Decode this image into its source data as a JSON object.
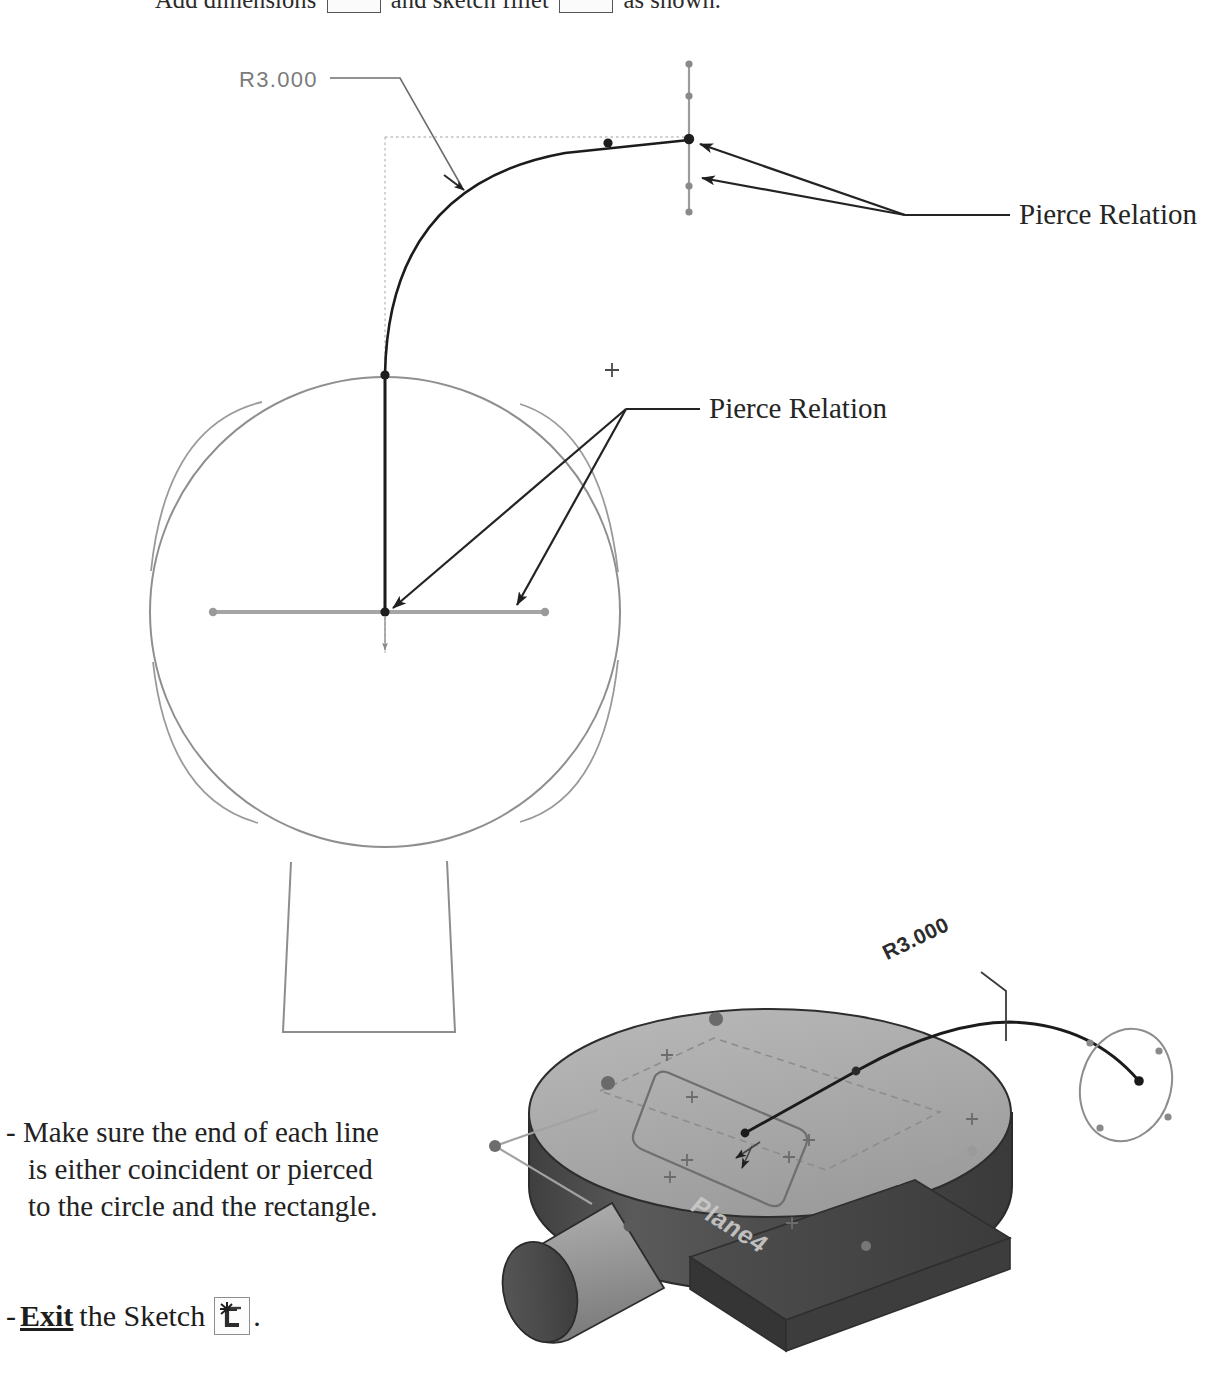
{
  "page": {
    "background_color": "#ffffff",
    "width": 1220,
    "height": 1383
  },
  "top_instruction": {
    "text_before": "Add dimensions",
    "text_middle": "and sketch fillet",
    "text_after": "as shown.",
    "dimension_icon_name": "smart-dimension-icon",
    "fillet_icon_name": "sketch-fillet-icon"
  },
  "sketch_view_2d": {
    "radius_dimension_label": "R3.000",
    "annotations": [
      {
        "id": "pierce-top",
        "label": "Pierce Relation"
      },
      {
        "id": "pierce-middle",
        "label": "Pierce Relation"
      }
    ],
    "entity_colors": {
      "active_sketch_line": "#1c1c1c",
      "reference_geometry": "#8e8e8e",
      "construction_dotted": "#b4b4b4",
      "dimension_text": "#7b7b7b",
      "leader_line": "#2a2a2a"
    }
  },
  "model_view_3d": {
    "radius_dimension_label": "R3.000",
    "plane_label": "Plane4",
    "surface_colors": {
      "top_face": "#adadad",
      "front_dark_face": "#4c4c4c",
      "side_face": "#6e6e6e",
      "boss_light": "#a8a8a8",
      "outline": "#2f2f2f"
    }
  },
  "notes": {
    "bullet": "-",
    "lines": [
      "Make sure the end of each line",
      "is either coincident or pierced",
      "to the circle and the rectangle."
    ]
  },
  "exit_step": {
    "bullet": "-",
    "action": "Exit",
    "object": "the Sketch",
    "trailing_punctuation": ".",
    "icon_name": "exit-sketch-icon"
  }
}
